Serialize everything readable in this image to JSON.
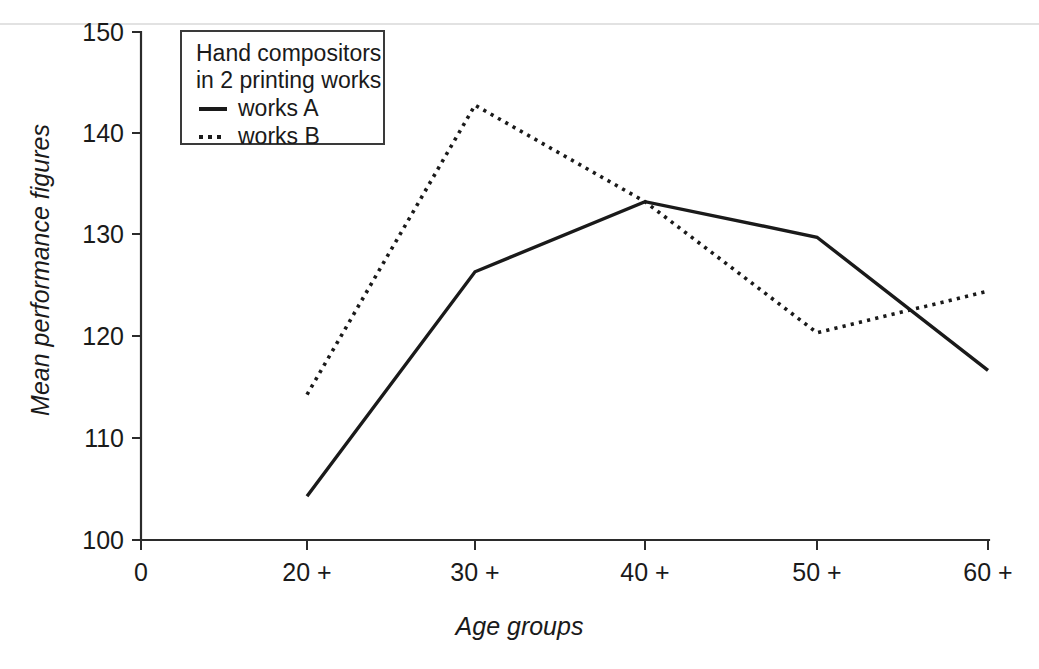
{
  "chart_data": {
    "type": "line",
    "title": "",
    "xlabel": "Age groups",
    "ylabel": "Mean performance figures",
    "categories": [
      "20 +",
      "30 +",
      "40 +",
      "50 +",
      "60 +"
    ],
    "x_origin_label": "0",
    "xticks": [
      "0",
      "20 +",
      "30 +",
      "40 +",
      "50 +",
      "60 +"
    ],
    "yticks": [
      "100",
      "110",
      "120",
      "130",
      "140",
      "150"
    ],
    "ylim": [
      100,
      150
    ],
    "grid": false,
    "legend_position": "top-left-inside",
    "legend_title_lines": [
      "Hand compositors",
      "in 2 printing works"
    ],
    "series": [
      {
        "name": "works A",
        "style": "solid",
        "values": [
          104.3,
          126.4,
          133.3,
          129.8,
          116.7
        ]
      },
      {
        "name": "works B",
        "style": "dotted",
        "values": [
          114.3,
          142.8,
          133.3,
          120.4,
          124.5
        ]
      }
    ]
  },
  "legend": {
    "title_line_1": "Hand compositors",
    "title_line_2": "in 2 printing works",
    "entry_a_label": "works A",
    "entry_b_label": "works B"
  },
  "axes": {
    "x_title": "Age groups",
    "y_title": "Mean performance figures",
    "y_tick_150": "150",
    "y_tick_140": "140",
    "y_tick_130": "130",
    "y_tick_120": "120",
    "y_tick_110": "110",
    "y_tick_100": "100",
    "x_tick_0": "0",
    "x_tick_20": "20 +",
    "x_tick_30": "30 +",
    "x_tick_40": "40 +",
    "x_tick_50": "50 +",
    "x_tick_60": "60 +"
  },
  "colors": {
    "line": "#1a1a1a",
    "axis": "#2b2b2b",
    "background": "#ffffff"
  }
}
